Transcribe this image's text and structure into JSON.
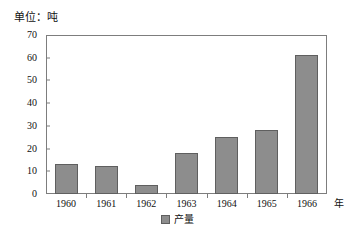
{
  "chart_data": {
    "type": "bar",
    "title": "",
    "unit_caption": "单位：吨",
    "xlabel": "年",
    "ylabel": "",
    "categories": [
      "1960",
      "1961",
      "1962",
      "1963",
      "1964",
      "1965",
      "1966"
    ],
    "values": [
      13,
      12.5,
      4,
      18,
      25,
      28,
      61
    ],
    "series": [
      {
        "name": "产量",
        "values": [
          13,
          12.5,
          4,
          18,
          25,
          28,
          61
        ]
      }
    ],
    "ylim": [
      0,
      70
    ],
    "yticks": [
      0,
      10,
      20,
      30,
      40,
      50,
      60,
      70
    ],
    "ytick_labels": [
      "0",
      "10",
      "20",
      "30",
      "40",
      "50",
      "60",
      "70"
    ],
    "grid": false,
    "legend_position": "bottom-center",
    "bar_color": "#8d8d8d",
    "bar_border_color": "#5f5f5f",
    "axis_color": "#7d7d7d"
  },
  "legend": {
    "entries": [
      {
        "label": "产量",
        "color": "#8d8d8d"
      }
    ]
  }
}
